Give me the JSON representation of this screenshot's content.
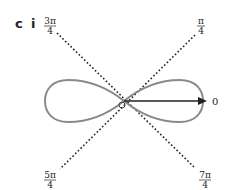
{
  "panel": {
    "letter": "c",
    "sub": "i"
  },
  "curve": {
    "type": "lemniscate",
    "color": "#8a8a8a"
  },
  "axis": {
    "label": "0",
    "color": "#222222"
  },
  "asymptotes": [
    {
      "angle": "3π/4",
      "num": "3π",
      "den": "4"
    },
    {
      "angle": "π/4",
      "num": "π",
      "den": "4"
    },
    {
      "angle": "5π/4",
      "num": "5π",
      "den": "4"
    },
    {
      "angle": "7π/4",
      "num": "7π",
      "den": "4"
    }
  ]
}
